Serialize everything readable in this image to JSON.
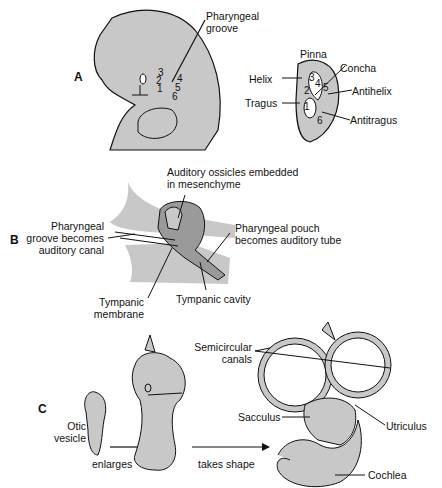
{
  "panels": {
    "a": {
      "letter": "A",
      "labels": {
        "pharyngeal_groove_1": "Pharyngeal",
        "pharyngeal_groove_2": "groove",
        "pinna": "Pinna",
        "helix": "Helix",
        "tragus": "Tragus",
        "concha": "Concha",
        "antihelix": "Antihelix",
        "antitragus": "Antitragus"
      },
      "hillock_numbers": [
        "1",
        "2",
        "3",
        "4",
        "5",
        "6"
      ]
    },
    "b": {
      "letter": "B",
      "labels": {
        "ossicles_1": "Auditory ossicles embedded",
        "ossicles_2": "in mesenchyme",
        "groove_1": "Pharyngeal",
        "groove_2": "groove becomes",
        "groove_3": "auditory canal",
        "pouch_1": "Pharyngeal pouch",
        "pouch_2": "becomes auditory tube",
        "tympanic_membrane_1": "Tympanic",
        "tympanic_membrane_2": "membrane",
        "tympanic_cavity": "Tympanic cavity"
      }
    },
    "c": {
      "letter": "C",
      "labels": {
        "otic_1": "Otic",
        "otic_2": "vesicle",
        "enlarges": "enlarges",
        "takes_shape": "takes shape",
        "semicircular_1": "Semicircular",
        "semicircular_2": "canals",
        "sacculus": "Sacculus",
        "utriculus": "Utriculus",
        "cochlea": "Cochlea"
      }
    }
  },
  "colors": {
    "tissue": "#c8c8c8",
    "dark_tissue": "#9a9a9a",
    "outline": "#111111"
  }
}
